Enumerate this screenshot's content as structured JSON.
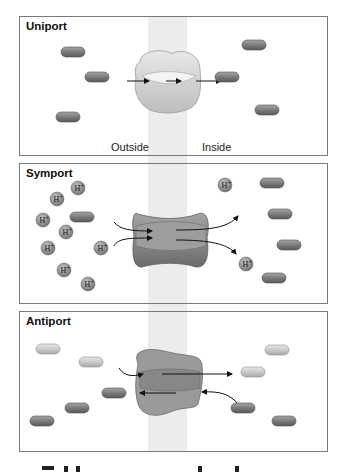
{
  "colors": {
    "membrane": "#ececec",
    "panel_border": "#7a7a7a",
    "molecule_dark": "#7b7b7b",
    "molecule_light": "#c9c9c9",
    "proton": "#8a8a8a",
    "transporter_uniport": "#d4d4d4",
    "transporter_symport": "#8c8c8c",
    "transporter_antiport": "#9a9a9a",
    "arrow": "#111111"
  },
  "panels": [
    {
      "title": "Uniport",
      "labels": {
        "outside": "Outside",
        "inside": "Inside"
      },
      "molecules": [
        {
          "x": 73,
          "y": 52,
          "shade": "dark"
        },
        {
          "x": 97,
          "y": 77,
          "shade": "dark"
        },
        {
          "x": 68,
          "y": 117,
          "shade": "dark"
        },
        {
          "x": 254,
          "y": 45,
          "shade": "dark"
        },
        {
          "x": 227,
          "y": 77,
          "shade": "dark"
        },
        {
          "x": 267,
          "y": 110,
          "shade": "dark"
        }
      ]
    },
    {
      "title": "Symport",
      "proton_label": "H+",
      "protons": [
        {
          "x": 78,
          "y": 188
        },
        {
          "x": 57,
          "y": 199
        },
        {
          "x": 43,
          "y": 220
        },
        {
          "x": 66,
          "y": 232
        },
        {
          "x": 48,
          "y": 248
        },
        {
          "x": 64,
          "y": 270
        },
        {
          "x": 88,
          "y": 284
        },
        {
          "x": 101,
          "y": 248
        },
        {
          "x": 225,
          "y": 185
        },
        {
          "x": 246,
          "y": 264
        }
      ],
      "molecules": [
        {
          "x": 82,
          "y": 217,
          "shade": "dark"
        },
        {
          "x": 272,
          "y": 183,
          "shade": "dark"
        },
        {
          "x": 280,
          "y": 214,
          "shade": "dark"
        },
        {
          "x": 289,
          "y": 245,
          "shade": "dark"
        },
        {
          "x": 274,
          "y": 278,
          "shade": "dark"
        }
      ]
    },
    {
      "title": "Antiport",
      "molecules": [
        {
          "x": 48,
          "y": 349,
          "shade": "light"
        },
        {
          "x": 91,
          "y": 362,
          "shade": "light"
        },
        {
          "x": 253,
          "y": 372,
          "shade": "light"
        },
        {
          "x": 277,
          "y": 350,
          "shade": "light"
        },
        {
          "x": 114,
          "y": 393,
          "shade": "dark"
        },
        {
          "x": 77,
          "y": 408,
          "shade": "dark"
        },
        {
          "x": 42,
          "y": 421,
          "shade": "dark"
        },
        {
          "x": 243,
          "y": 408,
          "shade": "dark"
        },
        {
          "x": 284,
          "y": 421,
          "shade": "dark"
        }
      ]
    }
  ]
}
